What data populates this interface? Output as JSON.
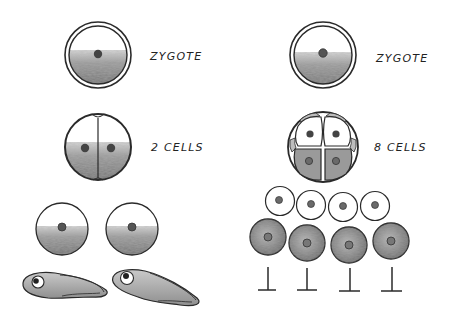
{
  "diagram": {
    "colors": {
      "ink": "#2a2a2a",
      "yolk_shade": "#8a8a8a",
      "dark_cell": "#7d7d7d",
      "nucleus": "#555555",
      "background": "#ffffff"
    },
    "left_column": {
      "stages": [
        {
          "id": "zygote",
          "label": "ZYGOTE"
        },
        {
          "id": "two-cells",
          "label": "2 CELLS"
        }
      ],
      "outcome": {
        "separated_cells_count": 2,
        "result": "tadpole",
        "result_count": 2
      }
    },
    "right_column": {
      "stages": [
        {
          "id": "zygote",
          "label": "ZYGOTE"
        },
        {
          "id": "eight-cells",
          "label": "8 CELLS"
        }
      ],
      "outcome": {
        "light_cells_count": 4,
        "dark_cells_count": 4,
        "result": "terminated",
        "result_count": 4
      }
    }
  }
}
